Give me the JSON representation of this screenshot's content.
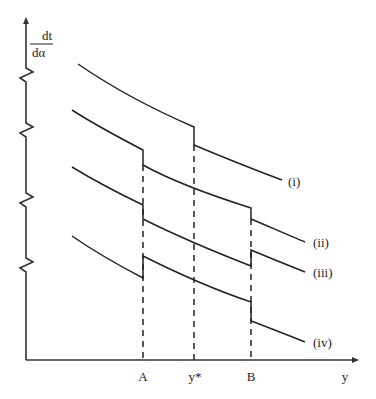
{
  "diagram": {
    "y_axis_label": {
      "numerator": "dt",
      "denominator": "dα"
    },
    "x_axis_label": "y",
    "x_ticks": [
      {
        "label": "A",
        "x": 143
      },
      {
        "label": "y*",
        "x": 194
      },
      {
        "label": "B",
        "x": 251
      }
    ],
    "curves": [
      {
        "label": "(i)",
        "path": "M78,64 C110,86 150,108 194,127 L194,145 C225,158 255,170 282,180",
        "label_x": 294,
        "label_y": 186
      },
      {
        "label": "(ii)",
        "path": "M72,110 C95,125 120,138 143,150 L143,165 C170,180 210,195 251,208 L251,219 C270,227 290,236 305,242",
        "label_x": 316,
        "label_y": 247
      },
      {
        "label": "(iii)",
        "path": "M72,167 C95,181 120,194 143,205 L143,219 C175,235 215,252 251,266 L251,250 C270,258 290,266 305,272",
        "label_x": 316,
        "label_y": 277
      },
      {
        "label": "(iv)",
        "path": "M72,236 C95,252 120,266 143,278 L143,256 C175,272 215,290 251,302 L251,321 C270,328 290,336 305,342",
        "label_x": 316,
        "label_y": 347
      }
    ],
    "axis_breaks_y": [
      75,
      130,
      200,
      265
    ],
    "dashed_guides": [
      {
        "name": "A",
        "x": 143,
        "y_top": 150
      },
      {
        "name": "y*",
        "x": 194,
        "y_top": 127
      },
      {
        "name": "B",
        "x": 251,
        "y_top": 208
      }
    ]
  }
}
